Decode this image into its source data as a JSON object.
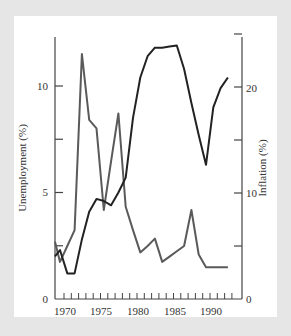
{
  "chart_data": {
    "type": "line",
    "title": "",
    "xlabel": "",
    "ylabel_left": "Unemployment (%)",
    "ylabel_right": "Inflation (%)",
    "x": [
      1969,
      1970,
      1971,
      1972,
      1973,
      1974,
      1975,
      1976,
      1977,
      1978,
      1979,
      1980,
      1981,
      1982,
      1983,
      1984,
      1985,
      1986,
      1987,
      1988,
      1989,
      1990,
      1991,
      1992,
      1993
    ],
    "series": [
      {
        "name": "Unemployment",
        "axis": "left",
        "color": "#2a2a2a",
        "values": [
          2.0,
          2.3,
          1.2,
          1.2,
          2.8,
          4.1,
          4.7,
          4.6,
          4.4,
          5.0,
          5.7,
          8.5,
          10.4,
          11.4,
          11.8,
          11.8,
          11.85,
          11.9,
          10.8,
          9.2,
          7.7,
          6.3,
          9.0,
          9.9,
          10.4
        ]
      },
      {
        "name": "Inflation",
        "axis": "right",
        "color": "#555555",
        "values": [
          5.4,
          3.5,
          5.0,
          6.5,
          23.1,
          16.9,
          16.1,
          8.4,
          13.0,
          17.5,
          8.7,
          6.5,
          4.4,
          5.0,
          5.7,
          3.5,
          4.0,
          4.5,
          5.0,
          8.4,
          4.2,
          3.0,
          3.0,
          3.0,
          3.0
        ]
      }
    ],
    "x_ticks": [
      "1970",
      "1975",
      "1980",
      "1985",
      "1990"
    ],
    "y_left_ticks": [
      "0",
      "5",
      "10"
    ],
    "y_right_ticks": [
      "0",
      "10",
      "20"
    ],
    "ylim_left": [
      0,
      12.5
    ],
    "ylim_right": [
      0,
      25
    ],
    "grid": false,
    "legend": "none"
  },
  "axis": {
    "left_title": "Unemployment (%)",
    "right_title": "Inflation (%)",
    "x_labels": [
      "1970",
      "1975",
      "1980",
      "1985",
      "1990"
    ],
    "left_labels": [
      "0",
      "5",
      "10"
    ],
    "right_labels": [
      "0",
      "10",
      "20"
    ]
  }
}
